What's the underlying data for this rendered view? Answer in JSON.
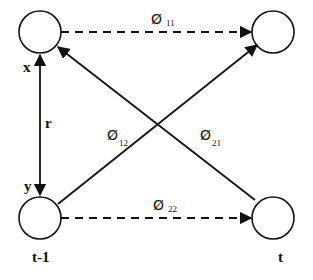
{
  "diagram": {
    "nodes": [
      {
        "id": "top-left",
        "cx": 40,
        "cy": 32,
        "r": 21
      },
      {
        "id": "top-right",
        "cx": 273,
        "cy": 32,
        "r": 21
      },
      {
        "id": "bottom-left",
        "cx": 40,
        "cy": 218,
        "r": 21
      },
      {
        "id": "bottom-right",
        "cx": 273,
        "cy": 218,
        "r": 21
      }
    ],
    "labels": {
      "x": "x",
      "y": "y",
      "r": "r",
      "t_minus_1": "t-1",
      "t": "t"
    },
    "edges": {
      "phi11": {
        "symbol": "Ø",
        "sub": "11",
        "style": "dashed"
      },
      "phi22": {
        "symbol": "Ø",
        "sub": "22",
        "style": "dashed"
      },
      "phi12": {
        "symbol": "Ø",
        "sub": "12",
        "style": "solid"
      },
      "phi21": {
        "symbol": "Ø",
        "sub": "21",
        "style": "solid"
      }
    },
    "colors": {
      "stroke": "#111111",
      "background": "#ffffff"
    }
  }
}
